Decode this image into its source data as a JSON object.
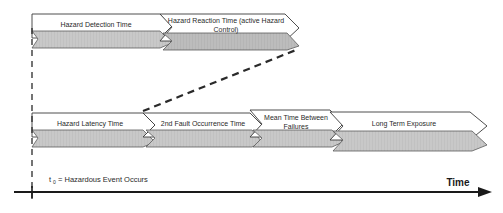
{
  "figure": {
    "type": "timeline-diagram",
    "background_color": "#ffffff",
    "line_color": "#2b2b2b",
    "band_fill": "#c9c9c9",
    "banner_fill": "#ffffff"
  },
  "axis": {
    "time_label": "Time",
    "origin_marker_name": "t0-tick"
  },
  "legend": {
    "symbol": "t",
    "subscript": "0",
    "text": "= Hazardous Event Occurs",
    "full_text": "t0 = Hazardous Event Occurs"
  },
  "rows": [
    {
      "id": "upper-timeline",
      "segments": [
        {
          "id": "hazard-detection-time",
          "label_line1": "Hazard Detection Time",
          "label_line2": ""
        },
        {
          "id": "hazard-reaction-time",
          "label_line1": "Hazard Reaction Time (active Hazard",
          "label_line2": "Control)"
        }
      ]
    },
    {
      "id": "lower-timeline",
      "segments": [
        {
          "id": "hazard-latency-time",
          "label_line1": "Hazard Latency Time",
          "label_line2": ""
        },
        {
          "id": "second-fault-occurrence-time",
          "label_line1": "2nd Fault Occurrence Time",
          "label_line2": ""
        },
        {
          "id": "mean-time-between-failures",
          "label_line1": "Mean Time Between",
          "label_line2": "Failures"
        },
        {
          "id": "long-term-exposure",
          "label_line1": "Long Term Exposure",
          "label_line2": ""
        }
      ]
    }
  ],
  "connector": {
    "id": "dashed-connector",
    "style": "dashed",
    "from": "second-fault-occurrence-time",
    "to": "hazard-reaction-time"
  }
}
